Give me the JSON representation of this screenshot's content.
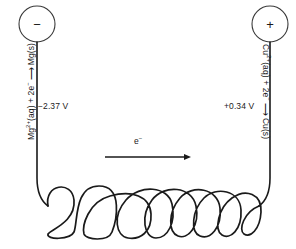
{
  "diagram": {
    "background_color": "#ffffff",
    "line_color": "#1a1a1a",
    "terminals": {
      "left": {
        "sign": "−",
        "name": "negative-terminal",
        "cx": 37,
        "cy": 24,
        "r": 18
      },
      "right": {
        "sign": "+",
        "name": "positive-terminal",
        "cx": 270,
        "cy": 24,
        "r": 18
      }
    },
    "half_reactions": {
      "left": {
        "species_ion": "Mg",
        "charge": "2+",
        "state_aq": "(aq)",
        "electrons": "2e",
        "electron_charge": "−",
        "product": "Mg(s)",
        "full_text": "Mg2+(aq) + 2e− ⟶ Mg(s)",
        "potential": "−2.37 V"
      },
      "right": {
        "species_ion": "Cu",
        "charge": "2+",
        "state_aq": "(aq)",
        "electrons": "2e",
        "electron_charge": "−",
        "product": "Cu(s)",
        "full_text": "Cu2+(aq) + 2e− ⟶ Cu(s)",
        "potential": "+0.34 V"
      }
    },
    "electron_flow": {
      "label": "e",
      "label_charge": "−",
      "direction": "left-to-right",
      "arrow_start_x": 105,
      "arrow_end_x": 191,
      "arrow_y": 157
    },
    "coil": {
      "loops": 9,
      "start_x": 32,
      "end_x": 264,
      "top_y": 188,
      "bottom_y": 237
    }
  }
}
